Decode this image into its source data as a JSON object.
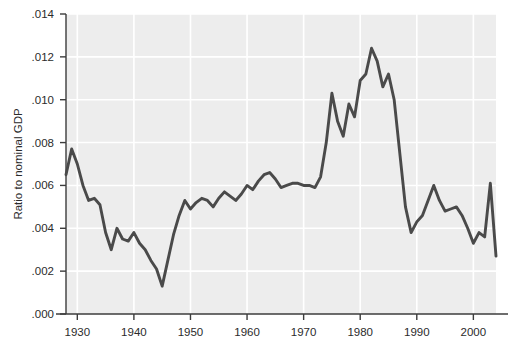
{
  "chart_data": {
    "type": "line",
    "title": "",
    "subtitle": "",
    "xlabel": "",
    "ylabel": "Ratio to nominal GDP",
    "xlim": [
      1928,
      2004
    ],
    "ylim": [
      0.0,
      0.014
    ],
    "grid": true,
    "legend_position": "none",
    "annotations": [],
    "xticks": [
      1930,
      1940,
      1950,
      1960,
      1970,
      1980,
      1990,
      2000
    ],
    "xtick_labels": [
      "1930",
      "1940",
      "1950",
      "1960",
      "1970",
      "1980",
      "1990",
      "2000"
    ],
    "yticks": [
      0.0,
      0.002,
      0.004,
      0.006,
      0.008,
      0.01,
      0.012,
      0.014
    ],
    "ytick_labels": [
      ".000",
      ".002",
      ".004",
      ".006",
      ".008",
      ".010",
      ".012",
      ".014"
    ],
    "series": [
      {
        "name": "Ratio to nominal GDP",
        "color": "#4a4a4a",
        "x": [
          1928,
          1929,
          1930,
          1931,
          1932,
          1933,
          1934,
          1935,
          1936,
          1937,
          1938,
          1939,
          1940,
          1941,
          1942,
          1943,
          1944,
          1945,
          1946,
          1947,
          1948,
          1949,
          1950,
          1951,
          1952,
          1953,
          1954,
          1955,
          1956,
          1957,
          1958,
          1959,
          1960,
          1961,
          1962,
          1963,
          1964,
          1965,
          1966,
          1967,
          1968,
          1969,
          1970,
          1971,
          1972,
          1973,
          1974,
          1975,
          1976,
          1977,
          1978,
          1979,
          1980,
          1981,
          1982,
          1983,
          1984,
          1985,
          1986,
          1987,
          1988,
          1989,
          1990,
          1991,
          1992,
          1993,
          1994,
          1995,
          1996,
          1997,
          1998,
          1999,
          2000,
          2001,
          2002,
          2003,
          2004
        ],
        "values": [
          0.0065,
          0.0077,
          0.007,
          0.006,
          0.0053,
          0.0054,
          0.0051,
          0.0038,
          0.003,
          0.004,
          0.0035,
          0.0034,
          0.0038,
          0.0033,
          0.003,
          0.0025,
          0.0021,
          0.0013,
          0.0025,
          0.0037,
          0.0046,
          0.0053,
          0.0049,
          0.0052,
          0.0054,
          0.0053,
          0.005,
          0.0054,
          0.0057,
          0.0055,
          0.0053,
          0.0056,
          0.006,
          0.0058,
          0.0062,
          0.0065,
          0.0066,
          0.0063,
          0.0059,
          0.006,
          0.0061,
          0.0061,
          0.006,
          0.006,
          0.0059,
          0.0064,
          0.008,
          0.0103,
          0.009,
          0.0083,
          0.0098,
          0.0092,
          0.0109,
          0.0112,
          0.0124,
          0.0118,
          0.0106,
          0.0112,
          0.01,
          0.0075,
          0.005,
          0.0038,
          0.0043,
          0.0046,
          0.0053,
          0.006,
          0.0053,
          0.0048,
          0.0049,
          0.005,
          0.0046,
          0.004,
          0.0033,
          0.0038,
          0.0036,
          0.0061,
          0.0027
        ]
      }
    ]
  },
  "axes": {
    "y_axis_title": "Ratio to nominal GDP",
    "x_axis_title": ""
  },
  "colors": {
    "line": "#4a4a4a",
    "plot_background": "#ededed",
    "gridline": "#ffffff",
    "axis": "#3c3c3c",
    "text": "#2b2b2b",
    "page_background": "#ffffff"
  }
}
